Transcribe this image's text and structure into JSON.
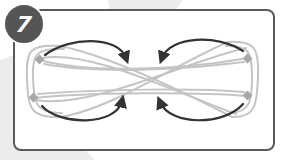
{
  "step": {
    "number": "7"
  },
  "colors": {
    "frame": "#5a5a5a",
    "badge": "#555555",
    "badge_text": "#ffffff",
    "cord": "#bdbdbd",
    "cord_node": "#a8a8a8",
    "arrow": "#333333",
    "background_band": "#ececec"
  },
  "diagram": {
    "nodes": [
      {
        "name": "top-left",
        "x": 40,
        "y": 60
      },
      {
        "name": "top-right",
        "x": 248,
        "y": 58
      },
      {
        "name": "bottom-left",
        "x": 34,
        "y": 98
      },
      {
        "name": "bottom-right",
        "x": 248,
        "y": 96
      }
    ],
    "arrows": [
      {
        "name": "top-left",
        "direction": "clockwise-toward-center"
      },
      {
        "name": "top-right",
        "direction": "counterclockwise-toward-center"
      },
      {
        "name": "bottom-left",
        "direction": "counterclockwise-toward-center"
      },
      {
        "name": "bottom-right",
        "direction": "clockwise-toward-center"
      }
    ]
  }
}
